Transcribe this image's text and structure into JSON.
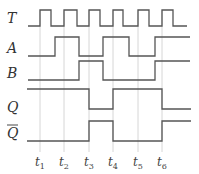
{
  "diagram": {
    "type": "timing-diagram",
    "colors": {
      "wave": "#555555",
      "guide": "#cccccc",
      "label": "#333333"
    },
    "signals": [
      {
        "name": "T",
        "overline": false,
        "label_y": 23,
        "high_y": 10,
        "low_y": 26,
        "points": [
          [
            28,
            26
          ],
          [
            40,
            26
          ],
          [
            40,
            10
          ],
          [
            51,
            10
          ],
          [
            51,
            26
          ],
          [
            64,
            26
          ],
          [
            64,
            10
          ],
          [
            77,
            10
          ],
          [
            77,
            26
          ],
          [
            89,
            26
          ],
          [
            89,
            10
          ],
          [
            100,
            10
          ],
          [
            100,
            26
          ],
          [
            113,
            26
          ],
          [
            113,
            10
          ],
          [
            123,
            10
          ],
          [
            123,
            26
          ],
          [
            138,
            26
          ],
          [
            138,
            10
          ],
          [
            149,
            10
          ],
          [
            149,
            26
          ],
          [
            162,
            26
          ],
          [
            162,
            10
          ],
          [
            173,
            10
          ],
          [
            173,
            26
          ],
          [
            187,
            26
          ]
        ]
      },
      {
        "name": "A",
        "overline": false,
        "label_y": 53,
        "high_y": 37,
        "low_y": 56,
        "points": [
          [
            28,
            56
          ],
          [
            55,
            56
          ],
          [
            55,
            37
          ],
          [
            79,
            37
          ],
          [
            79,
            56
          ],
          [
            103,
            56
          ],
          [
            103,
            37
          ],
          [
            129,
            37
          ],
          [
            129,
            56
          ],
          [
            155,
            56
          ],
          [
            155,
            37
          ],
          [
            190,
            37
          ]
        ]
      },
      {
        "name": "B",
        "overline": false,
        "label_y": 78,
        "high_y": 61,
        "low_y": 80,
        "points": [
          [
            28,
            80
          ],
          [
            79,
            80
          ],
          [
            79,
            61
          ],
          [
            103,
            61
          ],
          [
            103,
            80
          ],
          [
            155,
            80
          ],
          [
            155,
            61
          ],
          [
            190,
            61
          ]
        ]
      },
      {
        "name": "Q",
        "overline": false,
        "label_y": 112,
        "high_y": 89,
        "low_y": 109,
        "points": [
          [
            27,
            89
          ],
          [
            89,
            89
          ],
          [
            89,
            109
          ],
          [
            113,
            109
          ],
          [
            113,
            89
          ],
          [
            162,
            89
          ],
          [
            162,
            109
          ],
          [
            191,
            109
          ]
        ]
      },
      {
        "name": "Q",
        "overline": true,
        "label_y": 138,
        "high_y": 121,
        "low_y": 141,
        "points": [
          [
            27,
            141
          ],
          [
            89,
            141
          ],
          [
            89,
            121
          ],
          [
            113,
            121
          ],
          [
            113,
            141
          ],
          [
            162,
            141
          ],
          [
            162,
            121
          ],
          [
            191,
            121
          ]
        ]
      }
    ],
    "time_markers": [
      {
        "base": "t",
        "sub": "1",
        "x": 40
      },
      {
        "base": "t",
        "sub": "2",
        "x": 64
      },
      {
        "base": "t",
        "sub": "3",
        "x": 89
      },
      {
        "base": "t",
        "sub": "4",
        "x": 113
      },
      {
        "base": "t",
        "sub": "5",
        "x": 138
      },
      {
        "base": "t",
        "sub": "6",
        "x": 162
      }
    ],
    "guide_top": 10,
    "guide_bottom": 152,
    "time_label_y": 166
  }
}
